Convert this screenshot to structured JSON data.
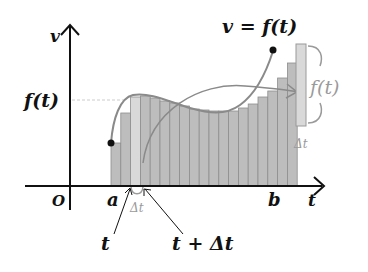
{
  "labels": {
    "y_axis": "v",
    "x_axis": "t",
    "origin": "O",
    "a": "a",
    "b": "b",
    "f_of_t": "f(t)",
    "curve": "v = f(t)",
    "t": "t",
    "t_plus_dt": "t + Δt",
    "dt": "Δt",
    "strip_height": "f(t)",
    "strip_width": "Δt"
  },
  "colors": {
    "axis": "#111111",
    "bar_fill": "#bdbdbd",
    "bar_highlight": "#d9d9d9",
    "bar_stroke": "#8e8e8e",
    "curve": "#8a8a8a",
    "arrow": "#9a9a9a",
    "grey_text": "#9a9a9a"
  },
  "bars": {
    "count": 19,
    "highlight_index": 2,
    "x_start": 111,
    "bar_width": 9.8,
    "baseline_y": 186,
    "tops": [
      143,
      113,
      97,
      96,
      98,
      101,
      103,
      106,
      109,
      110,
      111,
      111,
      111,
      108,
      104,
      97,
      91,
      78,
      63
    ]
  }
}
